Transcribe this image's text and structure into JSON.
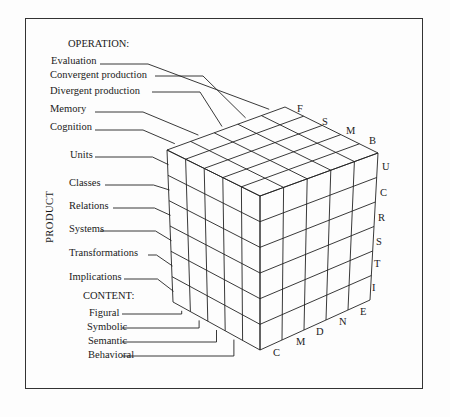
{
  "operation": {
    "heading": "OPERATION:",
    "items": [
      "Evaluation",
      "Convergent production",
      "Divergent production",
      "Memory",
      "Cognition"
    ],
    "codes": [
      "F",
      "S",
      "M",
      "B"
    ]
  },
  "product": {
    "heading": "PRODUCT",
    "items": [
      "Units",
      "Classes",
      "Relations",
      "Systems",
      "Transformations",
      "Implications"
    ],
    "codes": [
      "U",
      "C",
      "R",
      "S",
      "T",
      "I"
    ]
  },
  "content": {
    "heading": "CONTENT:",
    "items": [
      "Figural",
      "Symbolic",
      "Semantic",
      "Behavioral"
    ],
    "codes": [
      "C",
      "M",
      "D",
      "N",
      "E"
    ]
  }
}
